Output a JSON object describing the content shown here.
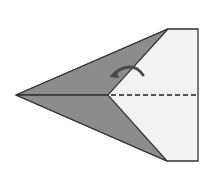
{
  "diagram": {
    "title": "",
    "colors": {
      "background": "#ffffff",
      "folded_flap": "#8c8c8c",
      "paper": "#f3f3f3",
      "stroke": "#333333",
      "arrow": "#4a4a4a"
    },
    "elements": [
      {
        "name": "paper-body",
        "type": "polygon"
      },
      {
        "name": "upper-flap",
        "type": "polygon"
      },
      {
        "name": "lower-flap",
        "type": "polygon"
      },
      {
        "name": "center-crease",
        "type": "solid-line"
      },
      {
        "name": "valley-fold-line",
        "type": "dashed-line"
      },
      {
        "name": "fold-arrow",
        "type": "curved-arrow"
      }
    ]
  }
}
